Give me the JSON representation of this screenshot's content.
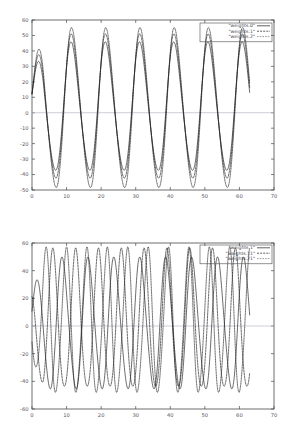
{
  "chart_data": [
    {
      "type": "line",
      "title": "",
      "xlabel": "",
      "ylabel": "",
      "xlim": [
        0,
        70
      ],
      "ylim": [
        -50,
        60
      ],
      "xticks": [
        0,
        10,
        20,
        30,
        40,
        50,
        60,
        70
      ],
      "yticks": [
        60,
        50,
        40,
        30,
        20,
        10,
        0,
        -10,
        -20,
        -30,
        -40,
        -50
      ],
      "grid": false,
      "legend_position": "top-right",
      "zero_line": true,
      "series": [
        {
          "name": "\"weights.0\"",
          "style": "solid",
          "amplitude": 41,
          "period": 9.9,
          "phase": 0.55,
          "offset": 3,
          "x_start": 0,
          "x_end": 63
        },
        {
          "name": "\"weights.1\"",
          "style": "dashed",
          "amplitude": 46,
          "period": 9.9,
          "phase": 0.5,
          "offset": 3,
          "x_start": 0,
          "x_end": 63
        },
        {
          "name": "\"weights.2\"",
          "style": "dotted",
          "amplitude": 51,
          "period": 9.9,
          "phase": 0.45,
          "offset": 2,
          "x_start": 0,
          "x_end": 63
        }
      ]
    },
    {
      "type": "line",
      "title": "",
      "xlabel": "",
      "ylabel": "",
      "xlim": [
        0,
        70
      ],
      "ylim": [
        -60,
        60
      ],
      "xticks": [
        0,
        10,
        20,
        30,
        40,
        50,
        60,
        70
      ],
      "yticks": [
        60,
        40,
        20,
        0,
        -20,
        -40,
        -60
      ],
      "grid": false,
      "legend_position": "top-right",
      "zero_line": true,
      "series": [
        {
          "name": "\"weights.1\"",
          "style": "solid",
          "amplitude": 47,
          "period": 7.5,
          "phase": 0.45,
          "offset": 1,
          "x_start": 0,
          "x_end": 63
        },
        {
          "name": "\"weights.11\"",
          "style": "dashed",
          "amplitude": 50,
          "period": 6.6,
          "phase": 2.1,
          "offset": 2,
          "x_start": 0,
          "x_end": 63
        },
        {
          "name": "\"weights.21\"",
          "style": "dotted",
          "amplitude": 52,
          "period": 5.9,
          "phase": 3.6,
          "offset": 2,
          "x_start": 0,
          "x_end": 63
        }
      ]
    }
  ]
}
